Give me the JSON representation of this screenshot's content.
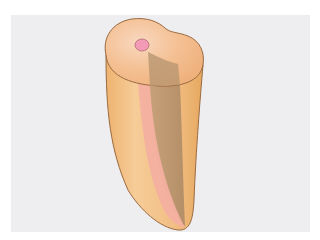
{
  "image": {
    "subject": "Tooth root cross-section illustration",
    "description": "Cut-away view of a single-rooted tooth showing the root canal (pulp) in pink, dentin in orange, and the sectioned canal wall in brown",
    "colors": {
      "background_panel": "#eeeef0",
      "frame": "#ffffff",
      "dentin": "#f0b97a",
      "dentin_light": "#f6cfa0",
      "dentin_top": "#f5c39a",
      "pulp": "#f4a6a0",
      "pulp_opening": "#f29ab6",
      "section_wall": "#b89670",
      "outline": "#9a6a40"
    }
  }
}
